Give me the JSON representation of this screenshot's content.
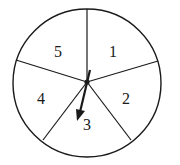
{
  "spinner": {
    "sections": [
      {
        "label": "1"
      },
      {
        "label": "2"
      },
      {
        "label": "3"
      },
      {
        "label": "4"
      },
      {
        "label": "5"
      }
    ],
    "pointer_on": "3",
    "stroke_color": "#1a1a1a",
    "background": "#ffffff"
  }
}
